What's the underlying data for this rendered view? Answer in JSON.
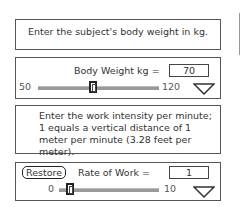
{
  "instructions": {
    "body_weight": "Enter the subject's body weight in kg.",
    "work_rate": "Enter the work intensity per minute; 1 equals a vertical distance of 1 meter per minute (3.28 feet per meter)."
  },
  "body_weight_control": {
    "label": "Body Weight kg =",
    "value": "70",
    "min": "50",
    "max": "120",
    "slider_position_pct": 28.6,
    "icon": "triangle-down-icon"
  },
  "work_rate_control": {
    "restore_label": "Restore",
    "label": "Rate of Work =",
    "value": "1",
    "min": "0",
    "max": "10",
    "slider_position_pct": 10,
    "icon": "triangle-down-icon"
  }
}
